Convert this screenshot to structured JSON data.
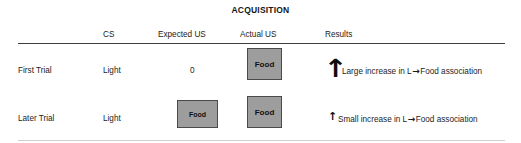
{
  "figure": {
    "title": "ACQUISITION",
    "columns": [
      "",
      "CS",
      "Expected US",
      "Actual US",
      "Results"
    ],
    "headers": {
      "cs": "CS",
      "expected_us": "Expected US",
      "actual_us": "Actual US",
      "results": "Results"
    },
    "rows": [
      {
        "label": "First Trial",
        "cs": "Light",
        "expected_us_value": "0",
        "expected_us_box": null,
        "actual_us_box": "Food",
        "arrow": "↑",
        "arrow_size": "large",
        "result_prefix": "Large increase in L",
        "result_arrow": "→",
        "result_suffix": "Food association",
        "result_full": "Large increase in L→Food association"
      },
      {
        "label": "Later Trial",
        "cs": "Light",
        "expected_us_value": "",
        "expected_us_box": "Food",
        "actual_us_box": "Food",
        "arrow": "↑",
        "arrow_size": "small",
        "result_prefix": "Small increase in L",
        "result_arrow": "→",
        "result_suffix": "Food association",
        "result_full": "Small increase in L→Food association"
      }
    ],
    "colors": {
      "box_fill": "#9d9d9d",
      "box_border": "#4a4a4a",
      "rule_top": "#3d3d3d",
      "rule_bottom": "#cfcfcf",
      "text": "#1c1c1c",
      "background": "#ffffff"
    }
  }
}
